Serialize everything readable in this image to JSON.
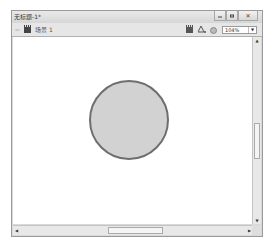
{
  "window": {
    "title": "无标题-1*",
    "buttons": {
      "minimize": "minimize",
      "maximize": "maximize",
      "close": "✕"
    }
  },
  "toolbar": {
    "back_icon": "⇦",
    "breadcrumb": "场景 1",
    "zoom_value": "104%",
    "zoom_arrow": "▼",
    "icons": [
      "edit-scene-icon",
      "edit-symbols-icon",
      "magnifier-icon"
    ]
  },
  "stage": {
    "shape": {
      "type": "circle",
      "fill": "#d2d2d2",
      "stroke": "#6e6e6e"
    }
  },
  "scrollbars": {
    "up": "▲",
    "down": "▼",
    "left": "◀",
    "right": "▶"
  }
}
